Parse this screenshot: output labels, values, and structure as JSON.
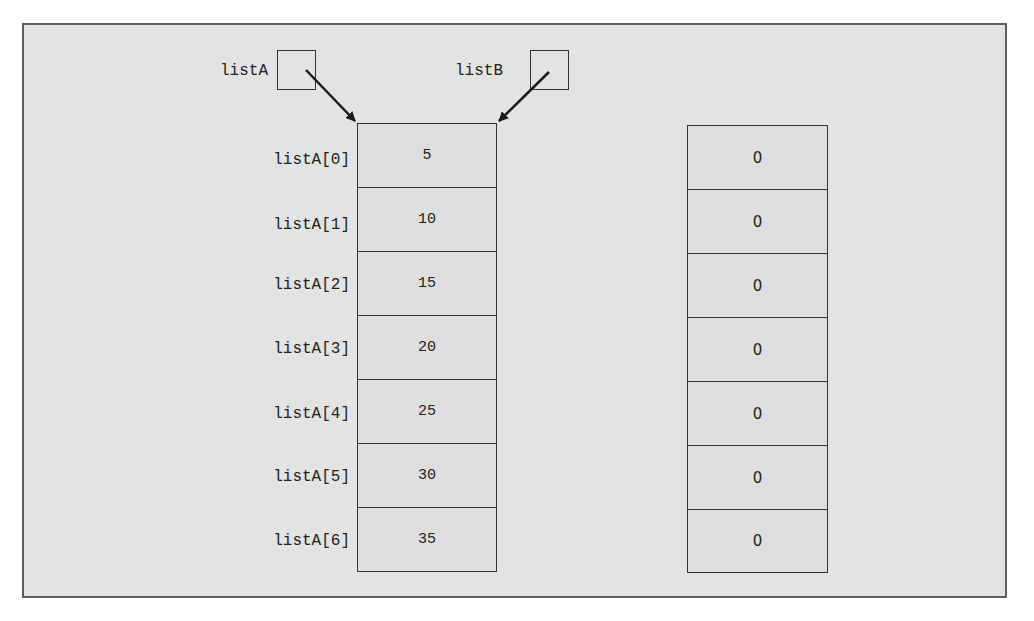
{
  "diagram": {
    "type": "array-reference-diagram",
    "pointers": [
      {
        "name": "listA",
        "label": "listA",
        "points_to": "array_a"
      },
      {
        "name": "listB",
        "label": "listB",
        "points_to": "array_a"
      }
    ],
    "array_a": {
      "index_labels": [
        "listA[0]",
        "listA[1]",
        "listA[2]",
        "listA[3]",
        "listA[4]",
        "listA[5]",
        "listA[6]"
      ],
      "values": [
        "5",
        "10",
        "15",
        "20",
        "25",
        "30",
        "35"
      ]
    },
    "array_b": {
      "values": [
        "0",
        "0",
        "0",
        "0",
        "0",
        "0",
        "0"
      ]
    },
    "colors": {
      "background": "#e3e3e3",
      "frame_border": "#5e5e5e",
      "line": "#222222"
    }
  }
}
